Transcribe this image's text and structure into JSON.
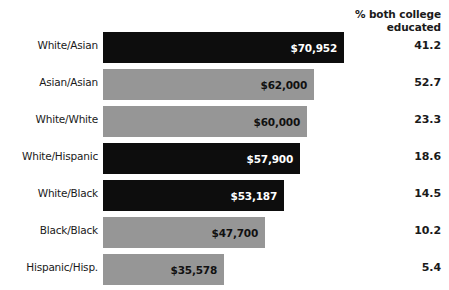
{
  "header": {
    "pct_column_line1": "% both college",
    "pct_column_line2": "educated"
  },
  "chart_data": {
    "type": "bar",
    "orientation": "horizontal",
    "title": "",
    "xlabel": "",
    "ylabel": "",
    "xlim": [
      0,
      75000
    ],
    "grid": false,
    "legend": "none",
    "categories": [
      "White/Asian",
      "Asian/Asian",
      "White/White",
      "White/Hispanic",
      "White/Black",
      "Black/Black",
      "Hispanic/Hisp."
    ],
    "values": [
      70952,
      62000,
      60000,
      57900,
      53187,
      47700,
      35578
    ],
    "value_labels": [
      "$70,952",
      "$62,000",
      "$60,000",
      "$57,900",
      "$53,187",
      "$47,700",
      "$35,578"
    ],
    "bar_colors": [
      "#0d0d0d",
      "#969696",
      "#969696",
      "#0d0d0d",
      "#0d0d0d",
      "#969696",
      "#969696"
    ],
    "series": [
      {
        "name": "Median household income",
        "values": [
          70952,
          62000,
          60000,
          57900,
          53187,
          47700,
          35578
        ]
      },
      {
        "name": "% both college educated",
        "values": [
          41.2,
          52.7,
          23.3,
          18.6,
          14.5,
          10.2,
          5.4
        ]
      }
    ],
    "pct_labels": [
      "41.2",
      "52.7",
      "23.3",
      "18.6",
      "14.5",
      "10.2",
      "5.4"
    ]
  },
  "rows": [
    {
      "category": "White/Asian",
      "value_label": "$70,952",
      "pct": "41.2",
      "style": "dark",
      "width_px": 241
    },
    {
      "category": "Asian/Asian",
      "value_label": "$62,000",
      "pct": "52.7",
      "style": "light",
      "width_px": 211
    },
    {
      "category": "White/White",
      "value_label": "$60,000",
      "pct": "23.3",
      "style": "light",
      "width_px": 204
    },
    {
      "category": "White/Hispanic",
      "value_label": "$57,900",
      "pct": "18.6",
      "style": "dark",
      "width_px": 197
    },
    {
      "category": "White/Black",
      "value_label": "$53,187",
      "pct": "14.5",
      "style": "dark",
      "width_px": 181
    },
    {
      "category": "Black/Black",
      "value_label": "$47,700",
      "pct": "10.2",
      "style": "light",
      "width_px": 162
    },
    {
      "category": "Hispanic/Hisp.",
      "value_label": "$35,578",
      "pct": "5.4",
      "style": "light",
      "width_px": 121
    }
  ],
  "colors": {
    "bar_dark": "#0d0d0d",
    "bar_light": "#969696",
    "text": "#1a1a1a",
    "background": "#ffffff"
  }
}
